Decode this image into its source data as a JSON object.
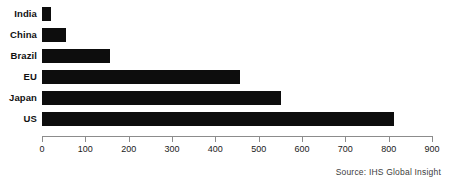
{
  "chart_data": {
    "type": "bar",
    "orientation": "horizontal",
    "title": "",
    "subtitle": "",
    "xlabel": "",
    "ylabel": "",
    "categories": [
      "India",
      "China",
      "Brazil",
      "EU",
      "Japan",
      "US"
    ],
    "values": [
      21,
      55,
      157,
      457,
      551,
      812
    ],
    "series": [
      {
        "name": "",
        "values": [
          21,
          55,
          157,
          457,
          551,
          812
        ]
      }
    ],
    "xlim": [
      0,
      900
    ],
    "xticks": [
      0,
      100,
      200,
      300,
      400,
      500,
      600,
      700,
      800,
      900
    ],
    "xtick_labels": [
      "0",
      "100",
      "200",
      "300",
      "400",
      "500",
      "600",
      "700",
      "800",
      "900"
    ],
    "grid": false,
    "legend": false,
    "legend_position": "none",
    "bar_color": "#0d0d0d",
    "axis_color": "#8c8c8c",
    "background_color": "#ffffff",
    "annotations": [
      "Source: IHS Global Insight"
    ]
  },
  "source": {
    "text": "Source: IHS Global Insight"
  }
}
